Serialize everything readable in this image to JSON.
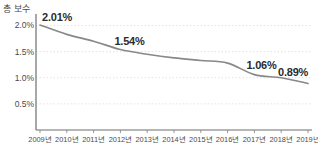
{
  "chart_data": {
    "type": "line",
    "title": "",
    "ylabel": "총 보수",
    "xlabel": "",
    "categories": [
      "2009년",
      "2010년",
      "2011년",
      "2012년",
      "2013년",
      "2014년",
      "2015년",
      "2016년",
      "2017년",
      "2018년",
      "2019년"
    ],
    "values": [
      2.01,
      1.83,
      1.7,
      1.54,
      1.45,
      1.38,
      1.33,
      1.28,
      1.06,
      1.0,
      0.89
    ],
    "unit": "%",
    "ylim": [
      0.0,
      2.22
    ],
    "yticks": [
      2.0,
      1.5,
      1.0,
      0.5
    ],
    "ytick_labels": [
      "2.0%",
      "1.5%",
      "1.0%",
      "0.5%"
    ],
    "grid": true,
    "legend": false,
    "series_color": "#888888",
    "data_labels": [
      {
        "index": 0,
        "text": "2.01%"
      },
      {
        "index": 3,
        "text": "1.54%"
      },
      {
        "index": 8,
        "text": "1.06%"
      },
      {
        "index": 10,
        "text": "0.89%"
      }
    ]
  },
  "axis": {
    "y_title": "총 보수"
  }
}
